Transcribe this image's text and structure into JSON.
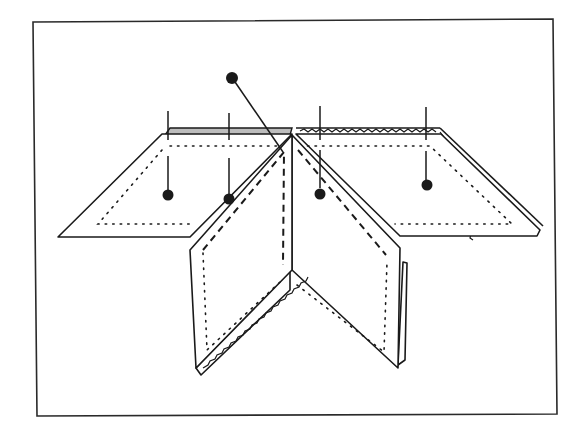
{
  "figure": {
    "type": "technical line illustration",
    "subject": "folded fabric panels (two flat wings and two standing front panels) pinned along a center fold, with stitching lines",
    "frame": {
      "stroke": "#2a2a2a"
    },
    "elements": {
      "left_wing": {
        "stitching": "dotted seam allowance line",
        "edge": "shaded binding strip along top"
      },
      "right_wing": {
        "stitching": "dotted seam allowance line",
        "edge": "zig-zag / pinked finish along top and right edge"
      },
      "left_front_panel": {
        "stitching": "dotted line and dashed basting line",
        "edge": "zig-zag finish along lower fold"
      },
      "right_front_panel": {
        "stitching": "dotted line and dashed basting line",
        "edge": "double edge on right side"
      },
      "pin": {
        "description": "long pin with round head inserted diagonally at top of center fold"
      }
    },
    "callouts": [
      {
        "id": 1,
        "x": 168,
        "marker": "dot"
      },
      {
        "id": 2,
        "x": 229,
        "marker": "dot"
      },
      {
        "id": 3,
        "x": 320,
        "marker": "dot"
      },
      {
        "id": 4,
        "x": 426,
        "marker": "dot"
      }
    ],
    "colors": {
      "line": "#1a1a1a",
      "fill": "#ffffff",
      "shade": "#bdbdbd"
    }
  }
}
